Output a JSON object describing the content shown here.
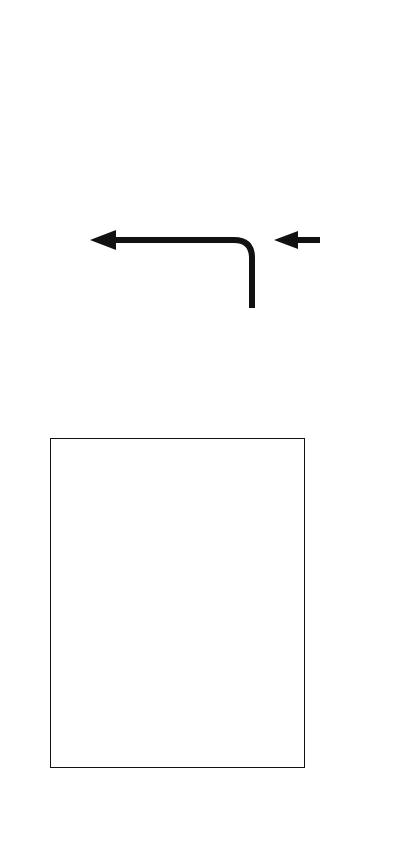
{
  "figure": {
    "orientation": "rotated-90-ccw",
    "panel_kind": "sea-ice-projection"
  },
  "chart_data": {
    "type": "line",
    "title": "",
    "xlabel": "",
    "ylabel": "(10⁶ km²)",
    "xlim": [
      1950,
      2100
    ],
    "ylim": [
      0.0,
      10.0
    ],
    "xticks": [
      1950,
      2000,
      2050,
      2100
    ],
    "xtick_labels": [
      "1950",
      "2000",
      "2050",
      "2100"
    ],
    "yticks": [
      0.0,
      2.0,
      4.0,
      6.0,
      8.0,
      10.0
    ],
    "ytick_labels": [
      "0.0",
      "2.0",
      "4.0",
      "6.0",
      "8.0",
      "10.0"
    ],
    "x_minor_interval": 10,
    "y_minor_interval": 0.5,
    "grid": false,
    "legend_position": "right-outside",
    "reference_line_y": 1.0,
    "reference_line_style": "dashed",
    "historical_end_year": 2005,
    "series": [
      {
        "name": "RCP2.6",
        "color": "#8d8d8d",
        "band_color": "#9a9a9a",
        "line_color": "#2b2b2b",
        "x": [
          1950,
          1960,
          1970,
          1980,
          1990,
          2000,
          2005,
          2010,
          2020,
          2030,
          2040,
          2050,
          2060,
          2070,
          2080,
          2090,
          2100
        ],
        "values": [
          7.4,
          7.3,
          7.2,
          7.1,
          6.8,
          6.4,
          6.0,
          5.6,
          5.0,
          4.5,
          4.1,
          3.8,
          3.7,
          3.6,
          3.6,
          3.6,
          3.6
        ],
        "band_low": [
          6.6,
          6.5,
          6.4,
          6.2,
          6.0,
          5.5,
          5.1,
          4.7,
          4.0,
          3.4,
          2.9,
          2.5,
          2.3,
          2.2,
          2.2,
          2.2,
          2.2
        ],
        "band_high": [
          8.2,
          8.1,
          8.0,
          7.9,
          7.7,
          7.3,
          7.0,
          6.6,
          6.1,
          5.7,
          5.4,
          5.2,
          5.1,
          5.1,
          5.1,
          5.1,
          5.1
        ]
      },
      {
        "name": "RCP8.5",
        "color": "#b8b8b8",
        "band_color": "#bdbdbd",
        "line_color": "#3a3a3a",
        "x": [
          1950,
          1960,
          1970,
          1980,
          1990,
          2000,
          2005,
          2010,
          2020,
          2030,
          2040,
          2050,
          2060,
          2070,
          2080,
          2090,
          2100
        ],
        "values": [
          7.4,
          7.3,
          7.2,
          7.1,
          6.8,
          6.4,
          6.0,
          5.5,
          4.6,
          3.7,
          2.8,
          1.9,
          1.3,
          0.9,
          0.7,
          0.6,
          0.5
        ],
        "band_low": [
          6.6,
          6.5,
          6.4,
          6.2,
          6.0,
          5.5,
          5.1,
          4.5,
          3.5,
          2.4,
          1.5,
          0.8,
          0.5,
          0.3,
          0.2,
          0.2,
          0.2
        ],
        "band_high": [
          8.2,
          8.1,
          8.0,
          7.9,
          7.7,
          7.3,
          7.0,
          6.5,
          5.7,
          4.9,
          4.1,
          3.2,
          2.4,
          1.8,
          1.4,
          1.2,
          1.1
        ]
      }
    ],
    "annotations": [
      {
        "name": "ice-free-threshold",
        "kind": "dashed-horizontal",
        "y": 1.0
      },
      {
        "name": "historical-divider",
        "kind": "solid-vertical",
        "x": 2005
      },
      {
        "name": "diagonal-guide",
        "kind": "solid-diagonal"
      }
    ]
  },
  "legend": {
    "title": "",
    "items": [
      {
        "label": "RCP2.6",
        "swatch_color": "#a0a0a0",
        "swatch_width": 80,
        "has_mean_tick": true
      },
      {
        "label": "RCP4.5",
        "swatch_color": "#e2e2e2",
        "swatch_width": 26,
        "has_mean_tick": false
      },
      {
        "label": "RCP6.0",
        "swatch_color": "#9a9a9a",
        "swatch_width": 6,
        "has_mean_tick": false
      },
      {
        "label": "RCP8.5",
        "swatch_color": "#8a8a8a",
        "swatch_width": 4,
        "has_mean_tick": false
      }
    ]
  },
  "maps": [
    {
      "name": "arctic-sea-ice-rcp26",
      "scenario": "RCP2.6",
      "description": "Arctic polar projection with extensive September sea ice",
      "ocean_color": "#3c3c3c",
      "land_color": "#828282",
      "ice_color": "#d9d9d9",
      "ice_edge_color": "#ffffff",
      "coast_color": "#ffffff",
      "ice_present": true
    },
    {
      "name": "arctic-sea-ice-rcp85",
      "scenario": "RCP8.5",
      "description": "Arctic polar projection that is nearly ice free in September",
      "ocean_color": "#3c3c3c",
      "land_color": "#828282",
      "ice_color": "#d9d9d9",
      "ice_edge_color": "#ffffff",
      "coast_color": "#ffffff",
      "ice_present": false
    }
  ],
  "connectors": [
    {
      "name": "rcp26-to-map-arrow",
      "from": "RCP2.6 legend bar",
      "to": "upper map"
    },
    {
      "name": "rcp85-to-map-arrow",
      "from": "RCP8.5 legend bar",
      "to": "lower map"
    }
  ],
  "colors": {
    "ink": "#111111",
    "band_dark": "#9a9a9a",
    "band_light": "#bdbdbd",
    "ocean": "#3c3c3c",
    "land": "#828282",
    "ice": "#d9d9d9"
  }
}
